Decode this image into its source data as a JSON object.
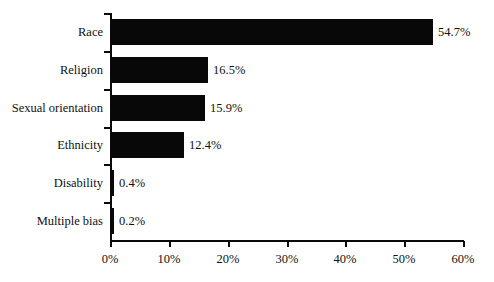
{
  "chart_data": {
    "type": "bar",
    "orientation": "horizontal",
    "title": "",
    "subtitle": "",
    "xlabel": "",
    "ylabel": "",
    "categories": [
      "Race",
      "Religion",
      "Sexual orientation",
      "Ethnicity",
      "Disability",
      "Multiple bias"
    ],
    "values": [
      54.7,
      16.5,
      15.9,
      12.4,
      0.4,
      0.2
    ],
    "value_labels": [
      "54.7%",
      "16.5%",
      "15.9%",
      "12.4%",
      "0.4%",
      "0.2%"
    ],
    "xlim": [
      0,
      60
    ],
    "xticks": [
      0,
      10,
      20,
      30,
      40,
      50,
      60
    ],
    "xtick_labels": [
      "0%",
      "10%",
      "20%",
      "30%",
      "40%",
      "50%",
      "60%"
    ],
    "grid": false,
    "legend": false,
    "legend_position": "none",
    "bar_color": "#080808",
    "axis_color": "#0a0a0a",
    "background": "#ffffff"
  },
  "axis": {
    "x_tick_labels": [
      "0%",
      "10%",
      "20%",
      "30%",
      "40%",
      "50%",
      "60%"
    ]
  },
  "bars": [
    {
      "category": "Race",
      "value": 54.7,
      "label": "54.7%"
    },
    {
      "category": "Religion",
      "value": 16.5,
      "label": "16.5%"
    },
    {
      "category": "Sexual orientation",
      "value": 15.9,
      "label": "15.9%"
    },
    {
      "category": "Ethnicity",
      "value": 12.4,
      "label": "12.4%"
    },
    {
      "category": "Disability",
      "value": 0.4,
      "label": "0.4%"
    },
    {
      "category": "Multiple bias",
      "value": 0.2,
      "label": "0.2%"
    }
  ]
}
